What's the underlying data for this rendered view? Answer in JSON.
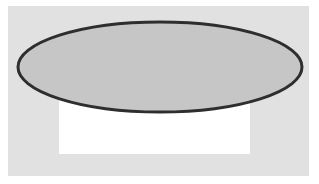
{
  "figure": {
    "colors": {
      "page_background": "#ffffff",
      "panel_background": "#e1e1e1",
      "rectangle_fill": "#ffffff",
      "ellipse_fill": "#c6c6c6",
      "ellipse_stroke": "#2e2e2e"
    },
    "shapes": [
      {
        "type": "rectangle",
        "name": "panel",
        "x": 8,
        "y": 6,
        "width": 301,
        "height": 170
      },
      {
        "type": "rectangle",
        "name": "white-rectangle",
        "x": 59,
        "y": 100,
        "width": 191,
        "height": 54
      },
      {
        "type": "ellipse",
        "name": "ellipse",
        "cx": 160,
        "cy": 67,
        "rx": 142,
        "ry": 45,
        "stroke_width": 3
      }
    ]
  }
}
